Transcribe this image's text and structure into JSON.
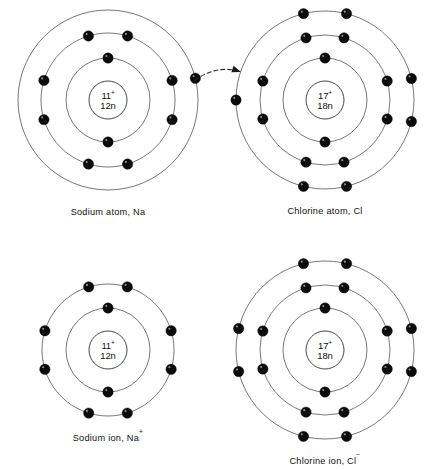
{
  "figure": {
    "background_color": "#ffffff",
    "shell_color": "#555555",
    "electron_color": "#0b0b0b",
    "text_color": "#111111"
  },
  "chart_data": {
    "type": "diagram",
    "title": "",
    "grid": false,
    "legend": "none",
    "panels": [
      {
        "id": "sodium-atom",
        "caption": "Sodium atom, Na",
        "caption_superscript": "",
        "center": [
          108,
          100
        ],
        "nucleus": {
          "protons": "11",
          "charge_sign": "+",
          "neutrons": "12n",
          "radius": 19
        },
        "shells": [
          {
            "index": 1,
            "radius": 42,
            "electron_count": 2,
            "electron_angles": [
              -90,
              90
            ]
          },
          {
            "index": 2,
            "radius": 67,
            "electron_count": 8,
            "electron_angles": [
              -107,
              -73,
              -17,
              17,
              73,
              107,
              163,
              197
            ]
          },
          {
            "index": 3,
            "radius": 90,
            "electron_count": 1,
            "electron_angles": [
              -14
            ]
          }
        ]
      },
      {
        "id": "chlorine-atom",
        "caption": "Chlorine atom, Cl",
        "caption_superscript": "",
        "center": [
          325,
          100
        ],
        "nucleus": {
          "protons": "17",
          "charge_sign": "+",
          "neutrons": "18n",
          "radius": 19
        },
        "shells": [
          {
            "index": 1,
            "radius": 42,
            "electron_count": 2,
            "electron_angles": [
              -90,
              90
            ]
          },
          {
            "index": 2,
            "radius": 65,
            "electron_count": 8,
            "electron_angles": [
              -107,
              -73,
              -17,
              17,
              73,
              107,
              163,
              197
            ]
          },
          {
            "index": 3,
            "radius": 89,
            "electron_count": 7,
            "electron_angles": [
              -104,
              -76,
              -14,
              14,
              76,
              104,
              180
            ]
          }
        ]
      },
      {
        "id": "sodium-ion",
        "caption": "Sodium ion, Na",
        "caption_superscript": "+",
        "center": [
          108,
          350
        ],
        "nucleus": {
          "protons": "11",
          "charge_sign": "+",
          "neutrons": "12n",
          "radius": 19
        },
        "shells": [
          {
            "index": 1,
            "radius": 42,
            "electron_count": 2,
            "electron_angles": [
              -90,
              90
            ]
          },
          {
            "index": 2,
            "radius": 66,
            "electron_count": 8,
            "electron_angles": [
              -107,
              -73,
              -17,
              17,
              73,
              107,
              163,
              197
            ]
          }
        ]
      },
      {
        "id": "chlorine-ion",
        "caption": "Chlorine ion, Cl",
        "caption_superscript": "−",
        "center": [
          325,
          350
        ],
        "nucleus": {
          "protons": "17",
          "charge_sign": "+",
          "neutrons": "18n",
          "radius": 19
        },
        "shells": [
          {
            "index": 1,
            "radius": 42,
            "electron_count": 2,
            "electron_angles": [
              -90,
              90
            ]
          },
          {
            "index": 2,
            "radius": 65,
            "electron_count": 8,
            "electron_angles": [
              -107,
              -73,
              -17,
              17,
              73,
              107,
              163,
              197
            ]
          },
          {
            "index": 3,
            "radius": 89,
            "electron_count": 8,
            "electron_angles": [
              -104,
              -76,
              -14,
              14,
              76,
              104,
              166,
              194
            ]
          }
        ]
      }
    ],
    "annotations": [
      {
        "id": "electron-transfer-arrow",
        "kind": "curved-dashed-arrow",
        "label": "",
        "from": [
          195,
          80
        ],
        "to": [
          241,
          72
        ],
        "control": [
          218,
          64
        ]
      }
    ]
  }
}
